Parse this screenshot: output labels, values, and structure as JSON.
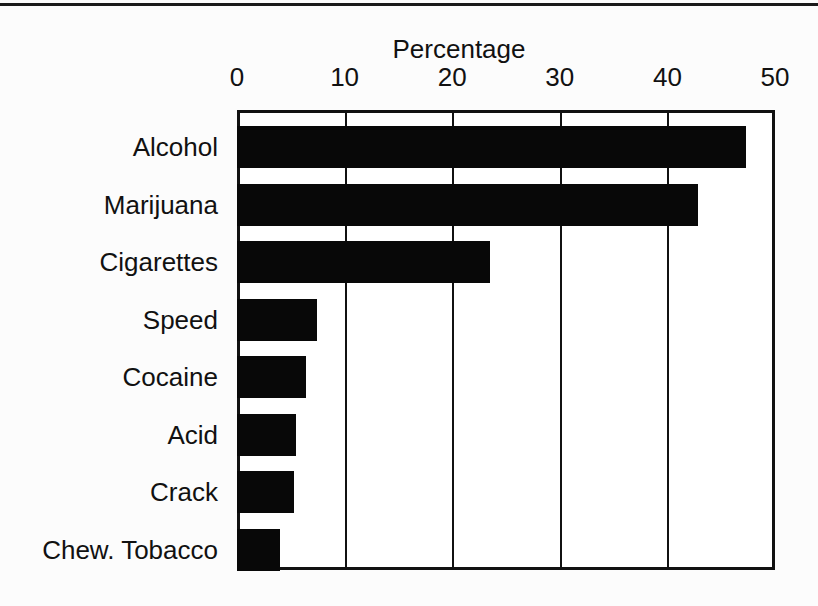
{
  "chart_data": {
    "type": "bar",
    "orientation": "horizontal",
    "title": "",
    "xlabel": "Percentage",
    "ylabel": "",
    "xlim": [
      0,
      50
    ],
    "xticks": [
      0,
      10,
      20,
      30,
      40,
      50
    ],
    "xtick_labels": [
      "0",
      "10",
      "20",
      "30",
      "40",
      "50"
    ],
    "grid": "vertical",
    "legend": "none",
    "bar_color": "#080808",
    "categories": [
      "Alcohol",
      "Marijuana",
      "Cigarettes",
      "Speed",
      "Cocaine",
      "Acid",
      "Crack",
      "Chew. Tobacco"
    ],
    "values": [
      47.3,
      42.8,
      23.5,
      7.4,
      6.4,
      5.5,
      5.3,
      4.0
    ]
  },
  "figure": {
    "axis_title": "Percentage",
    "frame_color": "#111111",
    "background": "#fcfcfc",
    "top_rule": true
  }
}
